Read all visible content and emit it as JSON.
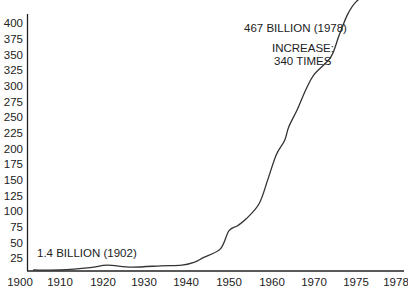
{
  "chart_data": {
    "type": "line",
    "title": "",
    "xlabel": "",
    "ylabel": "",
    "ylim": [
      0,
      420
    ],
    "grid": false,
    "legend": null,
    "x_tick_labels": [
      "1900",
      "1910",
      "1920",
      "1930",
      "1940",
      "1950",
      "1960",
      "1970",
      "1975",
      "1978"
    ],
    "y_tick_labels": [
      "25",
      "50",
      "75",
      "100",
      "125",
      "150",
      "175",
      "200",
      "225",
      "250",
      "275",
      "300",
      "325",
      "350",
      "375",
      "400"
    ],
    "y_ticks": [
      25,
      50,
      75,
      100,
      125,
      150,
      175,
      200,
      225,
      250,
      275,
      300,
      325,
      350,
      375,
      400
    ],
    "series": [
      {
        "name": "Value (billions)",
        "x": [
          1902,
          1910,
          1917,
          1921,
          1927,
          1934,
          1939,
          1942,
          1944,
          1948,
          1950,
          1952,
          1954,
          1957,
          1959,
          1961,
          1963,
          1964,
          1966,
          1968,
          1970,
          1972,
          1973,
          1974,
          1975,
          1976,
          1977,
          1978
        ],
        "values": [
          1.4,
          5,
          10,
          14,
          11,
          13,
          14,
          19,
          26,
          40,
          69,
          77,
          88,
          112,
          150,
          190,
          213,
          235,
          262,
          293,
          318,
          346,
          381,
          414,
          434,
          450,
          460,
          467
        ]
      }
    ],
    "annotations": [
      {
        "text": "1.4 BILLION (1902)",
        "x": 1902,
        "y": 1.4
      },
      {
        "text": "467 BILLION (1978)",
        "x": 1978,
        "y": 467
      },
      {
        "text": "INCREASE:",
        "line": 1
      },
      {
        "text": "340 TIMES",
        "line": 2
      }
    ]
  },
  "labels": {
    "start_annotation": "1.4 BILLION (1902)",
    "end_annotation": "467 BILLION (1978)",
    "increase_line1": "INCREASE:",
    "increase_line2": "340 TIMES"
  },
  "colors": {
    "line": "#333333",
    "axis": "#222222",
    "text": "#222222",
    "background": "#ffffff"
  }
}
